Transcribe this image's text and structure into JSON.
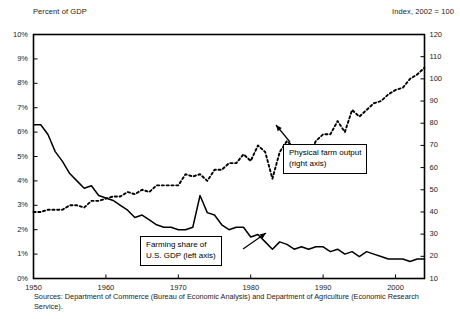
{
  "header": {
    "left_label": "Percent of GDP",
    "right_label": "Index, 2002 = 100"
  },
  "source_note": "Sources: Department of Commerce (Bureau of Economic Analysis) and Department of Agriculture (Economic Research Service).",
  "callouts": {
    "farming": {
      "line1": "Farming share of",
      "line2": "U.S. GDP (left axis)"
    },
    "output": {
      "line1": "Physical farm output",
      "line2": "(right axis)"
    }
  },
  "colors": {
    "axis": "#000000",
    "solid_series": "#000000",
    "dotted_series": "#000000",
    "background": "#ffffff",
    "text": "#222222"
  },
  "chart_data": {
    "type": "line",
    "title": "",
    "xlabel": "",
    "ylabel": "Percent of GDP",
    "y2label": "Index, 2002 = 100",
    "grid": false,
    "legend": "annotations",
    "xlim": [
      1950,
      2004
    ],
    "xticks": [
      1950,
      1960,
      1970,
      1980,
      1990,
      2000
    ],
    "ylim": [
      0,
      10
    ],
    "yticks": [
      0,
      1,
      2,
      3,
      4,
      5,
      6,
      7,
      8,
      9,
      10
    ],
    "ytick_labels": [
      "0%",
      "1%",
      "2%",
      "3%",
      "4%",
      "5%",
      "6%",
      "7%",
      "8%",
      "9%",
      "10%"
    ],
    "y2lim": [
      10,
      120
    ],
    "y2ticks": [
      10,
      20,
      30,
      40,
      50,
      60,
      70,
      80,
      90,
      100,
      110,
      120
    ],
    "y2tick_labels": [
      "10",
      "20",
      "30",
      "40",
      "50",
      "60",
      "70",
      "80",
      "90",
      "100",
      "110",
      "120"
    ],
    "series": [
      {
        "name": "Farming share of U.S. GDP (left axis)",
        "axis": "left",
        "style": "solid",
        "unit": "percent",
        "x": [
          1950,
          1951,
          1952,
          1953,
          1954,
          1955,
          1956,
          1957,
          1958,
          1959,
          1960,
          1961,
          1962,
          1963,
          1964,
          1965,
          1966,
          1967,
          1968,
          1969,
          1970,
          1971,
          1972,
          1973,
          1974,
          1975,
          1976,
          1977,
          1978,
          1979,
          1980,
          1981,
          1982,
          1983,
          1984,
          1985,
          1986,
          1987,
          1988,
          1989,
          1990,
          1991,
          1992,
          1993,
          1994,
          1995,
          1996,
          1997,
          1998,
          1999,
          2000,
          2001,
          2002,
          2003,
          2004
        ],
        "values": [
          6.3,
          6.3,
          5.9,
          5.2,
          4.8,
          4.3,
          4.0,
          3.7,
          3.8,
          3.4,
          3.3,
          3.2,
          3.0,
          2.8,
          2.5,
          2.6,
          2.4,
          2.2,
          2.1,
          2.1,
          2.0,
          2.0,
          2.1,
          3.4,
          2.7,
          2.6,
          2.2,
          2.0,
          2.1,
          2.1,
          1.7,
          1.8,
          1.5,
          1.2,
          1.5,
          1.4,
          1.2,
          1.3,
          1.2,
          1.3,
          1.3,
          1.1,
          1.2,
          1.0,
          1.1,
          0.9,
          1.1,
          1.0,
          0.9,
          0.8,
          0.8,
          0.8,
          0.7,
          0.8,
          0.8
        ]
      },
      {
        "name": "Physical farm output (right axis)",
        "axis": "right",
        "style": "dotted",
        "unit": "index",
        "x": [
          1950,
          1951,
          1952,
          1953,
          1954,
          1955,
          1956,
          1957,
          1958,
          1959,
          1960,
          1961,
          1962,
          1963,
          1964,
          1965,
          1966,
          1967,
          1968,
          1969,
          1970,
          1971,
          1972,
          1973,
          1974,
          1975,
          1976,
          1977,
          1978,
          1979,
          1980,
          1981,
          1982,
          1983,
          1984,
          1985,
          1986,
          1987,
          1988,
          1989,
          1990,
          1991,
          1992,
          1993,
          1994,
          1995,
          1996,
          1997,
          1998,
          1999,
          2000,
          2001,
          2002,
          2003,
          2004
        ],
        "values": [
          40,
          40,
          41,
          41,
          41,
          43,
          43,
          42,
          45,
          45,
          46,
          47,
          47,
          49,
          48,
          50,
          49,
          52,
          52,
          52,
          52,
          57,
          56,
          57,
          54,
          59,
          59,
          62,
          62,
          66,
          63,
          70,
          67,
          55,
          67,
          72,
          69,
          70,
          65,
          72,
          75,
          75,
          81,
          76,
          86,
          83,
          86,
          89,
          90,
          93,
          95,
          96,
          100,
          102,
          105
        ]
      }
    ],
    "annotations": [
      {
        "text": "Farming share of U.S. GDP (left axis)",
        "points_to_series": "solid"
      },
      {
        "text": "Physical farm output (right axis)",
        "points_to_series": "dotted"
      }
    ]
  }
}
